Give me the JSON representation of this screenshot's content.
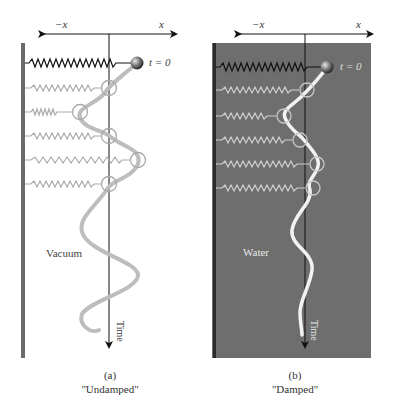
{
  "panels": [
    {
      "id": "a",
      "axis_neg_label": "−x",
      "axis_pos_label": "x",
      "t0_label": "t = 0",
      "medium_label": "Vacuum",
      "time_label": "Time",
      "caption_letter": "(a)",
      "caption_title": "\"Undamped\"",
      "background": "#ffffff",
      "curve_color": "#bdbdbd"
    },
    {
      "id": "b",
      "axis_neg_label": "−x",
      "axis_pos_label": "x",
      "t0_label": "t = 0",
      "medium_label": "Water",
      "time_label": "Time",
      "caption_letter": "(b)",
      "caption_title": "\"Damped\"",
      "background": "#6e6e6e",
      "curve_color": "#f2f2f2"
    }
  ]
}
